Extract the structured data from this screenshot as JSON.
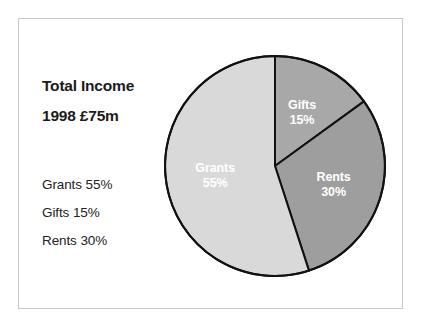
{
  "figure": {
    "background_color": "#ffffff",
    "frame_border_color": "#c8c8c8"
  },
  "text_panel": {
    "title_line_1": "Total Income",
    "title_line_2": "1998 £75m",
    "legend": [
      "Grants 55%",
      "Gifts 15%",
      "Rents 30%"
    ]
  },
  "chart_data": {
    "type": "pie",
    "title": "Total Income",
    "subtitle": "1998 £75m",
    "xlabel": "",
    "ylabel": "",
    "units": "percent",
    "total_label": "£75m",
    "start_angle_deg": 90,
    "direction": "clockwise",
    "outline_color": "#111111",
    "label_text_color": "#ffffff",
    "categories": [
      "Gifts",
      "Rents",
      "Grants"
    ],
    "values": [
      15,
      30,
      55
    ],
    "colors": [
      "#a8a8a8",
      "#9e9e9e",
      "#d9d9d9"
    ],
    "slices": [
      {
        "name": "Gifts",
        "label": "Gifts",
        "value": 15,
        "value_label": "15%",
        "color": "#a8a8a8",
        "start_deg": 0,
        "end_deg": 54
      },
      {
        "name": "Rents",
        "label": "Rents",
        "value": 30,
        "value_label": "30%",
        "color": "#9e9e9e",
        "start_deg": 54,
        "end_deg": 162
      },
      {
        "name": "Grants",
        "label": "Grants",
        "value": 55,
        "value_label": "55%",
        "color": "#d9d9d9",
        "start_deg": 162,
        "end_deg": 360
      }
    ],
    "legend_position": "left",
    "legend_entries": [
      "Grants 55%",
      "Gifts 15%",
      "Rents 30%"
    ],
    "geometry": {
      "center_x": 275,
      "center_y": 166,
      "radius": 110
    }
  }
}
